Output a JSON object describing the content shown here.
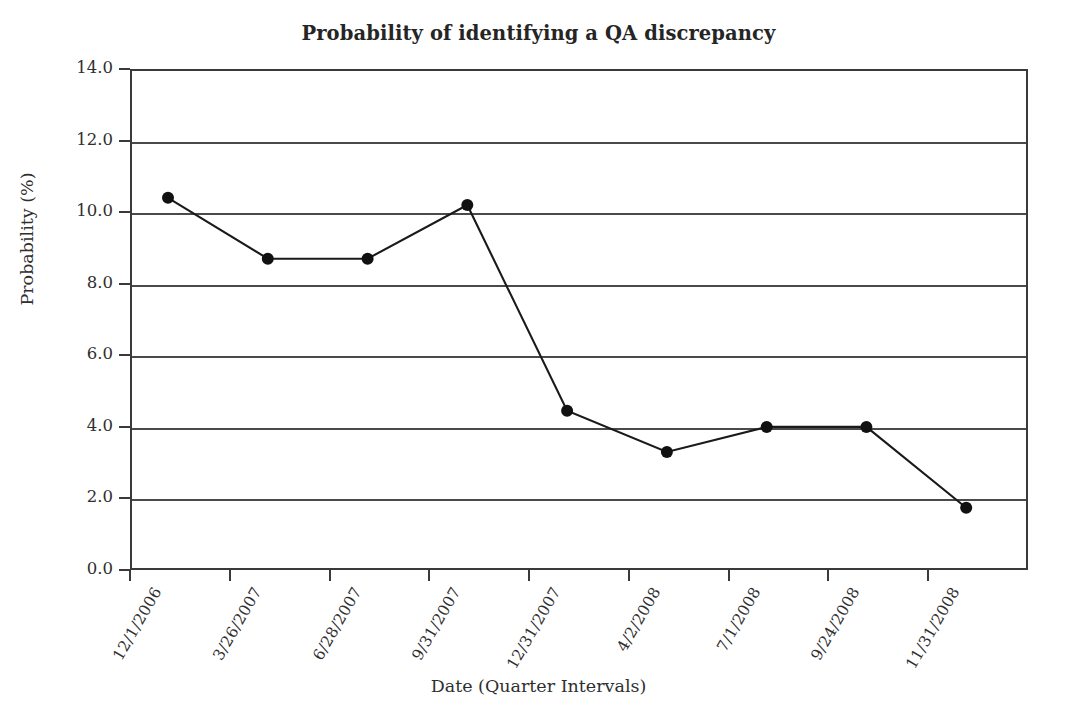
{
  "chart_data": {
    "type": "line",
    "title": "Probability of identifying a QA discrepancy",
    "xlabel": "Date (Quarter Intervals)",
    "ylabel": "Probability (%)",
    "categories": [
      "12/1/2006",
      "3/26/2007",
      "6/28/2007",
      "9/31/2007",
      "12/31/2007",
      "4/2/2008",
      "7/1/2008",
      "9/24/2008",
      "11/31/2008"
    ],
    "values": [
      10.4,
      8.7,
      8.7,
      10.2,
      4.45,
      3.3,
      4.0,
      4.0,
      1.74
    ],
    "series": [
      {
        "name": "Probability of identifying a QA discrepancy",
        "values": [
          10.4,
          8.7,
          8.7,
          10.2,
          4.45,
          3.3,
          4.0,
          4.0,
          1.74
        ]
      }
    ],
    "ylim": [
      0.0,
      14.0
    ],
    "ytick_labels": [
      "0.0",
      "2.0",
      "4.0",
      "6.0",
      "8.0",
      "10.0",
      "12.0",
      "14.0"
    ],
    "ytick_values": [
      0.0,
      2.0,
      4.0,
      6.0,
      8.0,
      10.0,
      12.0,
      14.0
    ],
    "grid": "horizontal",
    "legend": "none",
    "line_color": "#1a1a1a",
    "marker": "filled-circle",
    "marker_color": "#111111",
    "background_color": "#ffffff",
    "axis_color": "#3a3a3a",
    "gridline_color": "#4a4a4a"
  }
}
